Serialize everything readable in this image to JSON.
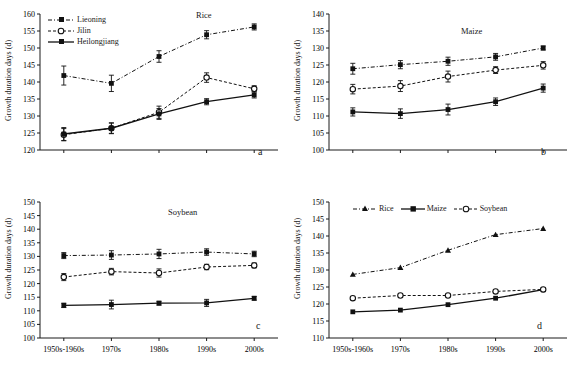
{
  "figure": {
    "width": 577,
    "height": 376,
    "background": "#ffffff",
    "axis_color": "#1a1a1a"
  },
  "axis": {
    "ylabel": "Growth duration days (d)",
    "categories": [
      "1950s-1960s",
      "1970s",
      "1980s",
      "1990s",
      "2000s"
    ]
  },
  "series_styles": {
    "liaoning": {
      "line": "dash-dot",
      "marker": "filled-square",
      "color": "#111111"
    },
    "jilin": {
      "line": "dashed",
      "marker": "open-circle",
      "color": "#111111"
    },
    "heilongjiang": {
      "line": "solid",
      "marker": "filled-square",
      "color": "#111111"
    },
    "rice": {
      "line": "dash-dot",
      "marker": "filled-triangle",
      "color": "#111111"
    },
    "maize": {
      "line": "solid",
      "marker": "filled-square",
      "color": "#111111"
    },
    "soybean": {
      "line": "dashed",
      "marker": "open-circle",
      "color": "#111111"
    }
  },
  "panels": {
    "a": {
      "letter": "a",
      "title": "Rice",
      "legend": [
        {
          "key": "liaoning",
          "label": "Lieoning"
        },
        {
          "key": "jilin",
          "label": "Jilin"
        },
        {
          "key": "heilongjiang",
          "label": "Heilongjiang"
        }
      ]
    },
    "b": {
      "letter": "b",
      "title": "Maize",
      "legend": []
    },
    "c": {
      "letter": "c",
      "title": "Soybean",
      "legend": []
    },
    "d": {
      "letter": "d",
      "title": "",
      "legend": [
        {
          "key": "rice",
          "label": "Rice"
        },
        {
          "key": "maize",
          "label": "Maize"
        },
        {
          "key": "soybean",
          "label": "Soybean"
        }
      ]
    }
  },
  "chart_data": [
    {
      "id": "a",
      "type": "line",
      "title": "Rice",
      "panel_letter": "a",
      "xlabel": "",
      "ylabel": "Growth duration days (d)",
      "categories": [
        "1950s-1960s",
        "1970s",
        "1980s",
        "1990s",
        "2000s"
      ],
      "ylim": [
        120,
        160
      ],
      "yticks": [
        120,
        125,
        130,
        135,
        140,
        145,
        150,
        155,
        160
      ],
      "xticklabels_shown": false,
      "grid": false,
      "legend_position": "top-left",
      "series": [
        {
          "name": "Lieoning",
          "values": [
            141.9,
            139.6,
            147.5,
            153.9,
            156.2
          ],
          "errors": [
            2.8,
            2.4,
            1.7,
            1.2,
            0.9
          ]
        },
        {
          "name": "Jilin",
          "values": [
            124.5,
            126.4,
            131.1,
            141.3,
            138.0
          ],
          "errors": [
            1.8,
            1.6,
            1.8,
            1.4,
            0.9
          ]
        },
        {
          "name": "Heilongjiang",
          "values": [
            124.7,
            126.4,
            130.6,
            134.2,
            136.2
          ],
          "errors": [
            1.9,
            1.5,
            1.6,
            0.9,
            0.9
          ]
        }
      ]
    },
    {
      "id": "b",
      "type": "line",
      "title": "Maize",
      "panel_letter": "b",
      "xlabel": "",
      "ylabel": "Growth duration days (d)",
      "categories": [
        "1950s-1960s",
        "1970s",
        "1980s",
        "1990s",
        "2000s"
      ],
      "ylim": [
        100,
        140
      ],
      "yticks": [
        100,
        105,
        110,
        115,
        120,
        125,
        130,
        135,
        140
      ],
      "xticklabels_shown": false,
      "grid": false,
      "legend_position": "none",
      "series": [
        {
          "name": "Lieoning",
          "values": [
            123.9,
            125.1,
            126.1,
            127.4,
            130.0
          ],
          "errors": [
            1.6,
            1.2,
            1.2,
            1.0,
            0.6
          ]
        },
        {
          "name": "Jilin",
          "values": [
            117.9,
            118.8,
            121.6,
            123.5,
            124.9
          ],
          "errors": [
            1.4,
            1.6,
            1.6,
            1.0,
            1.1
          ]
        },
        {
          "name": "Heilongjiang",
          "values": [
            111.2,
            110.7,
            111.9,
            114.2,
            118.2
          ],
          "errors": [
            1.2,
            1.4,
            1.6,
            1.1,
            1.2
          ]
        }
      ]
    },
    {
      "id": "c",
      "type": "line",
      "title": "Soybean",
      "panel_letter": "c",
      "xlabel": "",
      "ylabel": "Growth duration days (d)",
      "categories": [
        "1950s-1960s",
        "1970s",
        "1980s",
        "1990s",
        "2000s"
      ],
      "ylim": [
        100,
        150
      ],
      "yticks": [
        100,
        105,
        110,
        115,
        120,
        125,
        130,
        135,
        140,
        145,
        150
      ],
      "xticklabels_shown": true,
      "grid": false,
      "legend_position": "none",
      "series": [
        {
          "name": "Lieoning",
          "values": [
            130.3,
            130.5,
            130.9,
            131.6,
            130.9
          ],
          "errors": [
            1.1,
            1.6,
            1.7,
            1.2,
            1.0
          ]
        },
        {
          "name": "Jilin",
          "values": [
            122.4,
            124.4,
            123.9,
            126.1,
            126.7
          ],
          "errors": [
            1.3,
            1.2,
            1.5,
            1.0,
            0.9
          ]
        },
        {
          "name": "Heilongjiang",
          "values": [
            112.0,
            112.3,
            112.8,
            112.9,
            114.6
          ],
          "errors": [
            0.8,
            1.6,
            0.7,
            1.3,
            0.7
          ]
        }
      ]
    },
    {
      "id": "d",
      "type": "line",
      "title": "",
      "panel_letter": "d",
      "xlabel": "",
      "ylabel": "Growth duration days (d)",
      "categories": [
        "1950s-1960s",
        "1970s",
        "1980s",
        "1990s",
        "2000s"
      ],
      "ylim": [
        110,
        150
      ],
      "yticks": [
        110,
        115,
        120,
        125,
        130,
        135,
        140,
        145,
        150
      ],
      "xticklabels_shown": true,
      "grid": false,
      "legend_position": "top",
      "series": [
        {
          "name": "Rice",
          "values": [
            128.7,
            130.7,
            135.8,
            140.4,
            142.2
          ],
          "errors": [
            0,
            0,
            0,
            0,
            0
          ]
        },
        {
          "name": "Maize",
          "values": [
            117.7,
            118.2,
            119.8,
            121.7,
            124.2
          ],
          "errors": [
            0,
            0,
            0,
            0,
            0
          ]
        },
        {
          "name": "Soybean",
          "values": [
            121.7,
            122.5,
            122.5,
            123.7,
            124.3
          ],
          "errors": [
            0,
            0,
            0,
            0,
            0
          ]
        }
      ]
    }
  ]
}
